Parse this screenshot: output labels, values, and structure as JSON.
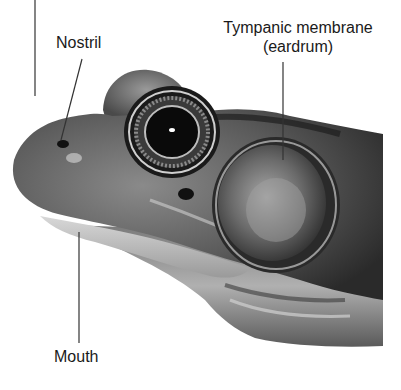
{
  "figure": {
    "labels": {
      "nostril": "Nostril",
      "tympanic_line1": "Tympanic membrane",
      "tympanic_line2": "(eardrum)",
      "mouth": "Mouth"
    },
    "colors": {
      "background": "#ffffff",
      "label_text": "#1a1a1a",
      "leader_line": "#333333",
      "skin_dark": "#2a2a2a",
      "skin_mid": "#6e6e6e",
      "skin_light": "#b8b8b8"
    }
  }
}
